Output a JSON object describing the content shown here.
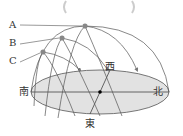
{
  "diagram": {
    "title": "",
    "labels": {
      "A": "A",
      "B": "B",
      "C": "C",
      "south": "南",
      "north": "北",
      "west": "西",
      "east": "東"
    },
    "colors": {
      "ground": "#e2e2e2",
      "line": "#555555",
      "sun": "#888888"
    }
  }
}
